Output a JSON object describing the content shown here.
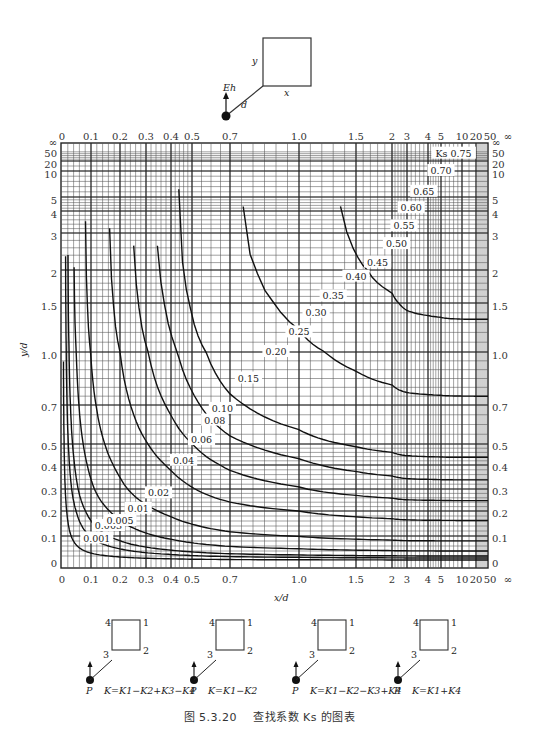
{
  "chart_data": {
    "type": "line",
    "subtitle": "Contour chart of coefficient K as a function of x/d and y/d",
    "xlabel": "x/d",
    "ylabel": "y/d",
    "x_ticks": [
      "0",
      "0.1",
      "0.2",
      "0.3",
      "0.4",
      "0.5",
      "0.7",
      "1.0",
      "1.5",
      "2",
      "3",
      "4",
      "5",
      "10",
      "20",
      "50",
      "∞"
    ],
    "y_ticks": [
      "0",
      "0.1",
      "0.2",
      "0.3",
      "0.4",
      "0.5",
      "0.7",
      "1.0",
      "1.5",
      "2",
      "3",
      "4",
      "5",
      "10",
      "20",
      "50",
      "∞"
    ],
    "grid": true,
    "contour_labels": [
      "0.001",
      "0.003",
      "0.005",
      "0.01",
      "0.02",
      "0.04",
      "0.06",
      "0.08",
      "0.10",
      "0.15",
      "0.20",
      "0.25",
      "0.30",
      "0.35",
      "0.40",
      "0.45",
      "0.50",
      "0.55",
      "0.60",
      "0.65",
      "0.70",
      "Ks 0.75"
    ],
    "series": [
      {
        "name": "0.001",
        "label_pos": {
          "x": 0.12,
          "y": 0.09
        }
      },
      {
        "name": "0.003",
        "label_pos": {
          "x": 0.16,
          "y": 0.14
        }
      },
      {
        "name": "0.005",
        "label_pos": {
          "x": 0.2,
          "y": 0.16
        }
      },
      {
        "name": "0.01",
        "label_pos": {
          "x": 0.27,
          "y": 0.21
        }
      },
      {
        "name": "0.02",
        "label_pos": {
          "x": 0.35,
          "y": 0.28
        }
      },
      {
        "name": "0.04",
        "label_pos": {
          "x": 0.46,
          "y": 0.42
        }
      },
      {
        "name": "0.06",
        "label_pos": {
          "x": 0.55,
          "y": 0.52
        }
      },
      {
        "name": "0.08",
        "label_pos": {
          "x": 0.62,
          "y": 0.62
        }
      },
      {
        "name": "0.10",
        "label_pos": {
          "x": 0.66,
          "y": 0.68
        }
      },
      {
        "name": "0.15",
        "label_pos": {
          "x": 0.78,
          "y": 0.85
        }
      },
      {
        "name": "0.20",
        "label_pos": {
          "x": 0.9,
          "y": 1.0
        }
      },
      {
        "name": "0.25",
        "label_pos": {
          "x": 1.0,
          "y": 1.2
        }
      },
      {
        "name": "0.30",
        "label_pos": {
          "x": 1.15,
          "y": 1.4
        }
      },
      {
        "name": "0.35",
        "label_pos": {
          "x": 1.3,
          "y": 1.6
        }
      },
      {
        "name": "0.40",
        "label_pos": {
          "x": 1.5,
          "y": 1.9
        }
      },
      {
        "name": "0.45",
        "label_pos": {
          "x": 1.8,
          "y": 2.2
        }
      },
      {
        "name": "0.50",
        "label_pos": {
          "x": 2.3,
          "y": 2.7
        }
      },
      {
        "name": "0.55",
        "label_pos": {
          "x": 2.8,
          "y": 3.3
        }
      },
      {
        "name": "0.60",
        "label_pos": {
          "x": 3.2,
          "y": 4.2
        }
      },
      {
        "name": "0.65",
        "label_pos": {
          "x": 3.8,
          "y": 6
        }
      },
      {
        "name": "0.70",
        "label_pos": {
          "x": 5,
          "y": 10
        }
      },
      {
        "name": "0.75",
        "label_pos": {
          "x": 8,
          "y": 40
        }
      }
    ]
  },
  "diagram_top": {
    "source_label": "Eh",
    "distance_label": "d",
    "width_label": "x",
    "height_label": "y"
  },
  "legend_cases": [
    {
      "formula": "K=K1−K2+K3−K4",
      "point": "P",
      "corners": [
        "4",
        "1",
        "2",
        "3"
      ]
    },
    {
      "formula": "K=K1−K2",
      "point": "P",
      "corners": [
        "4",
        "1",
        "2",
        "3"
      ]
    },
    {
      "formula": "K=K1−K2−K3+K4",
      "point": "P",
      "corners": [
        "4",
        "1",
        "2",
        "3"
      ]
    },
    {
      "formula": "K=K1+K4",
      "point": "P",
      "corners": [
        "4",
        "1",
        "2",
        "3"
      ]
    }
  ],
  "caption": {
    "figure_number": "图 5.3.20",
    "text": "查找系数 Ks 的图表"
  }
}
